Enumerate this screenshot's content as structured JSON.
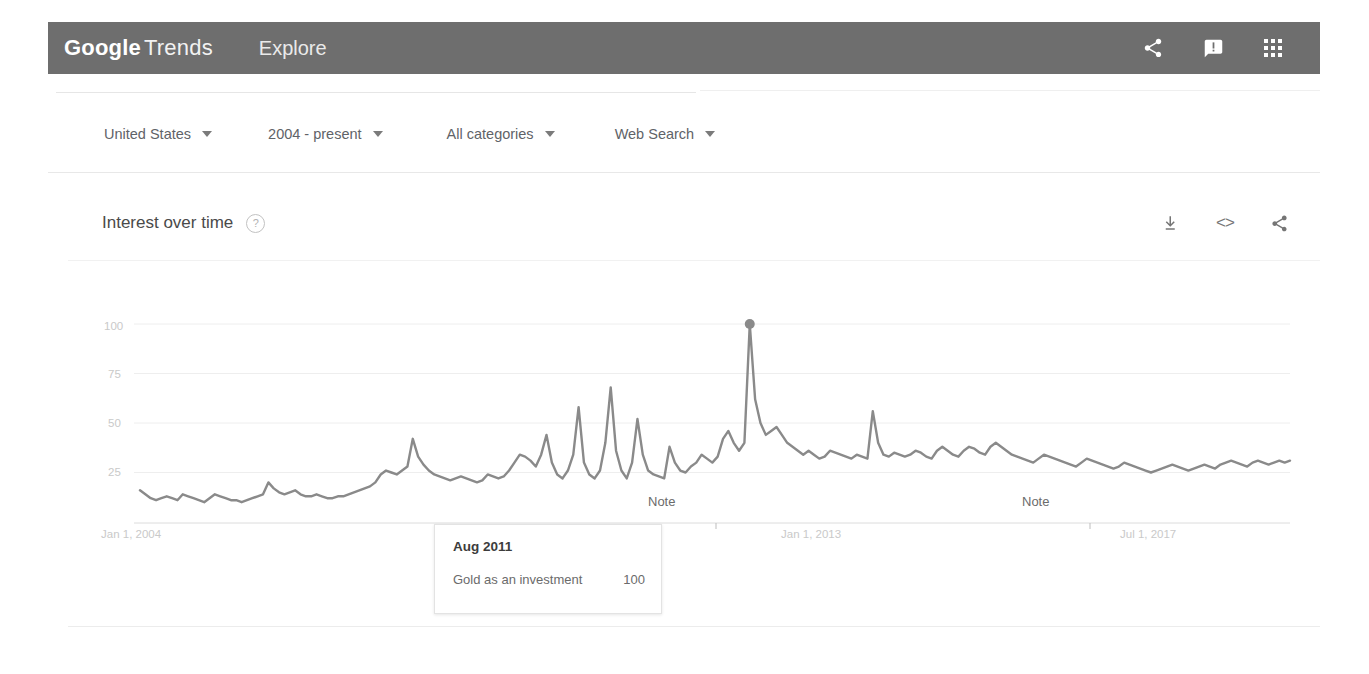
{
  "appbar": {
    "brand_google": "Google",
    "brand_trends": "Trends",
    "explore": "Explore",
    "icons": {
      "share": "share-icon",
      "feedback": "feedback-icon",
      "apps": "apps-grid-icon"
    }
  },
  "filters": [
    {
      "label": "United States"
    },
    {
      "label": "2004 - present"
    },
    {
      "label": "All categories"
    },
    {
      "label": "Web Search"
    }
  ],
  "card": {
    "title": "Interest over time",
    "help": "?",
    "actions": {
      "download": "download-icon",
      "embed": "<>",
      "share": "share-icon"
    }
  },
  "tooltip": {
    "date": "Aug 2011",
    "term": "Gold as an investment",
    "value": "100"
  },
  "annotations": [
    {
      "label": "Note",
      "x": 648
    },
    {
      "label": "Note",
      "x": 1022
    }
  ],
  "chart_data": {
    "type": "line",
    "title": "Interest over time",
    "xlabel": "",
    "ylabel": "",
    "ylim": [
      0,
      100
    ],
    "grid": true,
    "legend": false,
    "series_name": "Gold as an investment",
    "line_color": "#8a8a8a",
    "highlight_point": {
      "x_label": "Aug 2011",
      "value": 100
    },
    "ytick_labels": [
      "100",
      "75",
      "50",
      "25"
    ],
    "ytick_values": [
      100,
      75,
      50,
      25
    ],
    "xtick_labels": [
      "Jan 1, 2004",
      "Jul 1, 2008",
      "Jan 1, 2013",
      "Jul 1, 2017"
    ],
    "xtick_index": [
      0,
      54,
      108,
      162
    ],
    "x_start": "Jan 2004",
    "x_end": "2019",
    "values": [
      16,
      14,
      12,
      11,
      12,
      13,
      12,
      11,
      14,
      13,
      12,
      11,
      10,
      12,
      14,
      13,
      12,
      11,
      11,
      10,
      11,
      12,
      13,
      14,
      20,
      17,
      15,
      14,
      15,
      16,
      14,
      13,
      13,
      14,
      13,
      12,
      12,
      13,
      13,
      14,
      15,
      16,
      17,
      18,
      20,
      24,
      26,
      25,
      24,
      26,
      28,
      42,
      33,
      29,
      26,
      24,
      23,
      22,
      21,
      22,
      23,
      22,
      21,
      20,
      21,
      24,
      23,
      22,
      23,
      26,
      30,
      34,
      33,
      31,
      28,
      34,
      44,
      30,
      24,
      22,
      26,
      34,
      58,
      30,
      24,
      22,
      26,
      40,
      68,
      36,
      26,
      22,
      30,
      52,
      34,
      26,
      24,
      23,
      22,
      38,
      30,
      26,
      25,
      28,
      30,
      34,
      32,
      30,
      33,
      42,
      46,
      40,
      36,
      40,
      100,
      62,
      50,
      44,
      46,
      48,
      44,
      40,
      38,
      36,
      34,
      36,
      34,
      32,
      33,
      36,
      35,
      34,
      33,
      32,
      34,
      33,
      32,
      56,
      40,
      34,
      33,
      35,
      34,
      33,
      34,
      36,
      35,
      33,
      32,
      36,
      38,
      36,
      34,
      33,
      36,
      38,
      37,
      35,
      34,
      38,
      40,
      38,
      36,
      34,
      33,
      32,
      31,
      30,
      32,
      34,
      33,
      32,
      31,
      30,
      29,
      28,
      30,
      32,
      31,
      30,
      29,
      28,
      27,
      28,
      30,
      29,
      28,
      27,
      26,
      25,
      26,
      27,
      28,
      29,
      28,
      27,
      26,
      27,
      28,
      29,
      28,
      27,
      29,
      30,
      31,
      30,
      29,
      28,
      30,
      31,
      30,
      29,
      30,
      31,
      30,
      31
    ]
  }
}
